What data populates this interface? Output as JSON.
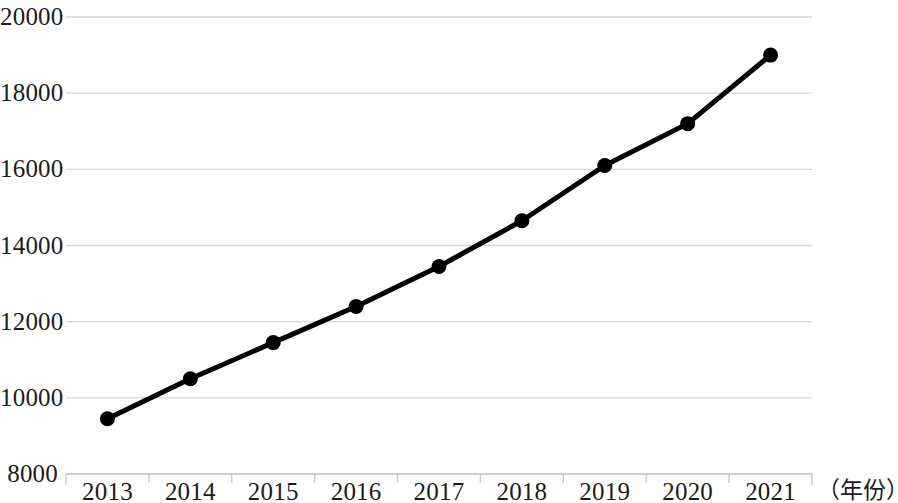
{
  "chart_data": {
    "type": "line",
    "title": "",
    "subtitle": "",
    "xlabel": "（年份）",
    "ylabel": "",
    "categories": [
      "2013",
      "2014",
      "2015",
      "2016",
      "2017",
      "2018",
      "2019",
      "2020",
      "2021"
    ],
    "values": [
      9450,
      10500,
      11450,
      12400,
      13450,
      14650,
      16100,
      17200,
      19000
    ],
    "series": [
      {
        "name": "",
        "values": [
          9450,
          10500,
          11450,
          12400,
          13450,
          14650,
          16100,
          17200,
          19000
        ]
      }
    ],
    "ylim": [
      8000,
      20000
    ],
    "y_ticks": [
      8000,
      10000,
      12000,
      14000,
      16000,
      18000,
      20000
    ],
    "y_tick_labels": [
      "8000",
      "10000",
      "12000",
      "14000",
      "16000",
      "18000",
      "20000"
    ],
    "x_tick_labels": [
      "2013",
      "2014",
      "2015",
      "2016",
      "2017",
      "2018",
      "2019",
      "2020",
      "2021"
    ],
    "grid": true,
    "grid_axis": "y",
    "legend": false,
    "legend_position": "none",
    "marker": "circle",
    "colors": {
      "line": "#000000",
      "marker": "#000000",
      "grid": "#d6d6d6",
      "axis": "#c9c9c9",
      "text": "#1c1c1c",
      "background": "#ffffff"
    },
    "annotations": []
  },
  "axis": {
    "unit_label": "（年份）"
  }
}
